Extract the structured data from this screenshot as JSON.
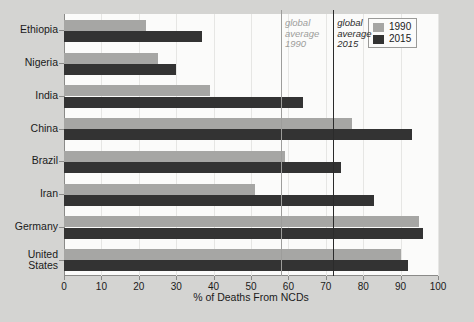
{
  "chart_data": {
    "type": "bar",
    "orientation": "horizontal",
    "title": "",
    "xlabel": "% of Deaths From NCDs",
    "ylabel": "",
    "xlim": [
      0,
      100
    ],
    "xticks": [
      0,
      10,
      20,
      30,
      40,
      50,
      60,
      70,
      80,
      90,
      100
    ],
    "grid": true,
    "legend_position": "top-right",
    "categories": [
      "Ethiopia",
      "Nigeria",
      "India",
      "China",
      "Brazil",
      "Iran",
      "Germany",
      "United States"
    ],
    "series": [
      {
        "name": "1990",
        "color": "#a6a6a4",
        "values": [
          22,
          25,
          39,
          77,
          59,
          51,
          95,
          90
        ]
      },
      {
        "name": "2015",
        "color": "#333333",
        "values": [
          37,
          30,
          64,
          93,
          74,
          83,
          96,
          92
        ]
      }
    ],
    "annotations": [
      {
        "name": "global average 1990",
        "label_lines": [
          "global",
          "average",
          "1990"
        ],
        "value": 58,
        "color": "#9d9d9b"
      },
      {
        "name": "global average 2015",
        "label_lines": [
          "global",
          "average",
          "2015"
        ],
        "value": 72,
        "color": "#2b2b2b"
      }
    ]
  },
  "legend": {
    "items": [
      {
        "label": "1990",
        "color": "#a6a6a4"
      },
      {
        "label": "2015",
        "color": "#333333"
      }
    ]
  },
  "axis": {
    "x_title": "% of Deaths From NCDs",
    "tick_labels": [
      "0",
      "10",
      "20",
      "30",
      "40",
      "50",
      "60",
      "70",
      "80",
      "90",
      "100"
    ]
  },
  "annotations": {
    "avg1990": {
      "line1": "global",
      "line2": "average",
      "line3": "1990"
    },
    "avg2015": {
      "line1": "global",
      "line2": "average",
      "line3": "2015"
    }
  },
  "colors": {
    "series_1990": "#a6a6a4",
    "series_2015": "#333333",
    "background": "#d4d4d2",
    "plot_background": "#fbfbfa",
    "axis": "#8a8a88"
  }
}
